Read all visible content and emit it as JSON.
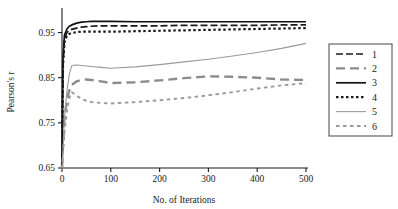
{
  "chart_data": {
    "type": "line",
    "title": "",
    "xlabel": "No. of Iterations",
    "ylabel": "Pearson's r",
    "xlim": [
      0,
      500
    ],
    "ylim": [
      0.65,
      1.0
    ],
    "xticks": [
      0,
      100,
      200,
      300,
      400,
      500
    ],
    "yticks": [
      0.65,
      0.75,
      0.85,
      0.95
    ],
    "xtick_labels": [
      "0",
      "100",
      "200",
      "300",
      "400",
      "500"
    ],
    "ytick_labels": [
      "0.65",
      "0.75",
      "0.85",
      "0.95"
    ],
    "grid": false,
    "legend_position": "right-outside",
    "x": [
      0,
      2,
      5,
      10,
      15,
      20,
      30,
      40,
      50,
      60,
      80,
      100,
      150,
      200,
      250,
      300,
      350,
      400,
      450,
      500
    ],
    "series": [
      {
        "name": "1",
        "label": "1",
        "style": "dashed",
        "color": "#1a1a1a",
        "width": 1.7,
        "dash": "7,3",
        "values": [
          0.652,
          0.88,
          0.935,
          0.95,
          0.955,
          0.957,
          0.96,
          0.962,
          0.963,
          0.964,
          0.965,
          0.965,
          0.965,
          0.965,
          0.966,
          0.966,
          0.966,
          0.966,
          0.967,
          0.967
        ]
      },
      {
        "name": "2",
        "label": "2",
        "style": "long-dashed",
        "color": "#8c8c8c",
        "width": 2.4,
        "dash": "9,5",
        "values": [
          0.651,
          0.7,
          0.76,
          0.8,
          0.822,
          0.834,
          0.842,
          0.845,
          0.846,
          0.845,
          0.842,
          0.838,
          0.84,
          0.844,
          0.849,
          0.853,
          0.852,
          0.85,
          0.846,
          0.845
        ]
      },
      {
        "name": "3",
        "label": "3",
        "style": "solid",
        "color": "#111111",
        "width": 1.7,
        "dash": "",
        "values": [
          0.653,
          0.89,
          0.944,
          0.958,
          0.964,
          0.967,
          0.971,
          0.973,
          0.974,
          0.975,
          0.975,
          0.975,
          0.974,
          0.974,
          0.974,
          0.974,
          0.974,
          0.974,
          0.974,
          0.974
        ]
      },
      {
        "name": "4",
        "label": "4",
        "style": "dotted",
        "color": "#1a1a1a",
        "width": 2.2,
        "dash": "2.5,2.5",
        "values": [
          0.65,
          0.875,
          0.928,
          0.943,
          0.947,
          0.949,
          0.951,
          0.952,
          0.952,
          0.952,
          0.952,
          0.952,
          0.953,
          0.954,
          0.955,
          0.956,
          0.957,
          0.958,
          0.959,
          0.96
        ]
      },
      {
        "name": "5",
        "label": "5",
        "style": "thin-solid",
        "color": "#9a9a9a",
        "width": 1.1,
        "dash": "",
        "values": [
          0.65,
          0.69,
          0.76,
          0.82,
          0.858,
          0.877,
          0.878,
          0.877,
          0.876,
          0.875,
          0.873,
          0.871,
          0.874,
          0.879,
          0.885,
          0.891,
          0.898,
          0.906,
          0.915,
          0.926
        ]
      },
      {
        "name": "6",
        "label": "6",
        "style": "fine-dashed",
        "color": "#9a9a9a",
        "width": 1.9,
        "dash": "3.5,3.5",
        "values": [
          0.649,
          0.68,
          0.73,
          0.775,
          0.805,
          0.818,
          0.81,
          0.803,
          0.799,
          0.796,
          0.794,
          0.793,
          0.796,
          0.8,
          0.805,
          0.811,
          0.818,
          0.826,
          0.833,
          0.838
        ]
      }
    ]
  },
  "legend": {
    "items": [
      {
        "label": "1"
      },
      {
        "label": "2"
      },
      {
        "label": "3"
      },
      {
        "label": "4"
      },
      {
        "label": "5"
      },
      {
        "label": "6"
      }
    ]
  }
}
